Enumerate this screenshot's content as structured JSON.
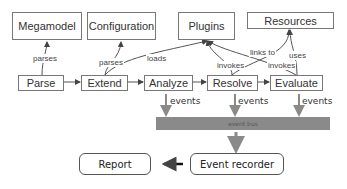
{
  "top_boxes": {
    "megamodel": "Megamodel",
    "configuration": "Configuration",
    "plugins": "Plugins",
    "resources": "Resources"
  },
  "pipeline": [
    "Parse",
    "Extend",
    "Analyze",
    "Resolve",
    "Evaluate"
  ],
  "edge_labels": {
    "parse_megamodel": "parses",
    "extend_configuration": "parses",
    "extend_plugins": "loads",
    "resolve_plugins": "invokes",
    "evaluate_plugins": "invokes",
    "resolve_resources": "links to",
    "evaluate_resources": "uses"
  },
  "events": [
    "events",
    "events",
    "events"
  ],
  "event_bus": "event bus",
  "event_recorder": "Event recorder",
  "report": "Report",
  "colors": {
    "bus": "#8a8a8a",
    "arrow_gray": "#8a8a8a",
    "box_border": "#777777"
  }
}
